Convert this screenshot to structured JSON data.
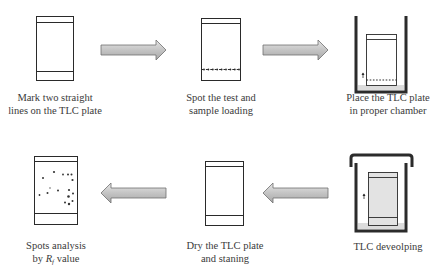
{
  "diagram": {
    "colors": {
      "outline": "#2a2a2a",
      "chamber_wall": "#2b2b2b",
      "arrow_fill": "#c8c8c8",
      "arrow_stroke": "#6e6e6e",
      "solvent": "#d9d9d9",
      "developed_plate": "#dcdcdc",
      "spot": "#333333"
    },
    "steps": [
      {
        "id": 1,
        "label_line1": "Mark two straight",
        "label_line2": "lines on the TLC plate",
        "icon": "tlc-plate-marked-icon"
      },
      {
        "id": 2,
        "label_line1": "Spot the test and",
        "label_line2": "sample loading",
        "icon": "tlc-plate-spotted-icon"
      },
      {
        "id": 3,
        "label_line1": "Place the TLC plate",
        "label_line2": "in proper chamber",
        "icon": "open-chamber-icon"
      },
      {
        "id": 4,
        "label_line1": "TLC deveolping",
        "label_line2": "",
        "icon": "covered-chamber-icon"
      },
      {
        "id": 5,
        "label_line1": "Dry the TLC plate",
        "label_line2": "and staning",
        "icon": "tlc-plate-dry-icon"
      },
      {
        "id": 6,
        "label_line1": "Spots analysis",
        "label_line2_prefix": "by ",
        "label_line2_var": "R",
        "label_line2_sub": "f",
        "label_line2_suffix": " value",
        "icon": "tlc-plate-spots-icon"
      }
    ],
    "flow": [
      {
        "from": 1,
        "to": 2,
        "direction": "right"
      },
      {
        "from": 2,
        "to": 3,
        "direction": "right"
      },
      {
        "from": 3,
        "to": 4,
        "direction": "down"
      },
      {
        "from": 4,
        "to": 5,
        "direction": "left"
      },
      {
        "from": 5,
        "to": 6,
        "direction": "left"
      }
    ]
  }
}
